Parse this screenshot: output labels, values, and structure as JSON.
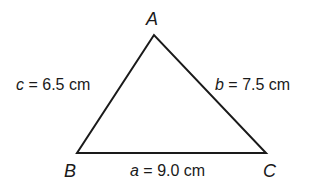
{
  "diagram": {
    "type": "triangle",
    "stroke_color": "#1a1a1a",
    "background": "#ffffff",
    "vertices": [
      {
        "name": "A",
        "x": 154,
        "y": 35
      },
      {
        "name": "B",
        "x": 77,
        "y": 153
      },
      {
        "name": "C",
        "x": 266,
        "y": 153
      }
    ],
    "vertex_labels": {
      "A": "A",
      "B": "B",
      "C": "C"
    },
    "sides": {
      "a": {
        "var": "a",
        "eq": "= 9.0 cm",
        "between": "B-C"
      },
      "b": {
        "var": "b",
        "eq": "= 7.5 cm",
        "between": "A-C"
      },
      "c": {
        "var": "c",
        "eq": "= 6.5 cm",
        "between": "A-B"
      }
    }
  }
}
